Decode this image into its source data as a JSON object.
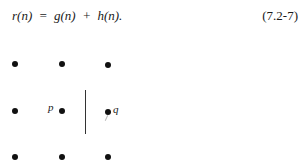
{
  "equation": {
    "text": "r(n)  =  g(n)  +  h(n).",
    "number": "(7.2-7)"
  },
  "figure": {
    "grid": "3x3 dots",
    "labels": {
      "p": "p",
      "q": "q"
    }
  }
}
